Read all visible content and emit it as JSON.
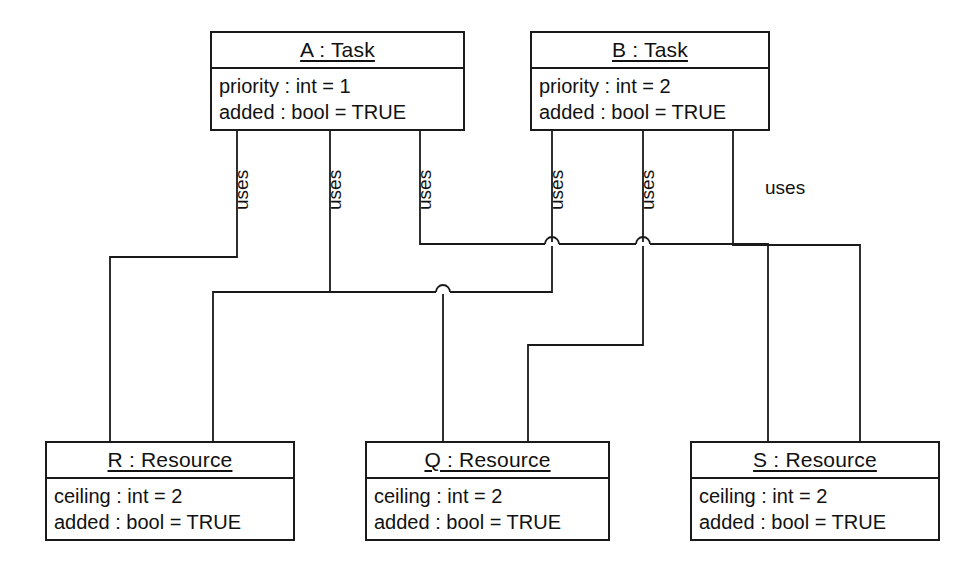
{
  "diagram": {
    "kind": "uml-object-diagram",
    "background_color": "#ffffff",
    "line_color": "#1a1a1a",
    "text_color": "#111111",
    "objects": [
      {
        "id": "A",
        "title": "A : Task",
        "attributes": [
          "priority : int = 1",
          "added : bool = TRUE"
        ],
        "x": 210,
        "y": 31,
        "w": 255,
        "h": 100
      },
      {
        "id": "B",
        "title": "B : Task",
        "attributes": [
          "priority : int = 2",
          "added : bool = TRUE"
        ],
        "x": 530,
        "y": 31,
        "w": 240,
        "h": 100
      },
      {
        "id": "R",
        "title": "R : Resource",
        "attributes": [
          "ceiling : int = 2",
          "added : bool = TRUE"
        ],
        "x": 45,
        "y": 441,
        "w": 250,
        "h": 100
      },
      {
        "id": "Q",
        "title": "Q : Resource",
        "attributes": [
          "ceiling : int = 2",
          "added : bool = TRUE"
        ],
        "x": 365,
        "y": 441,
        "w": 245,
        "h": 100
      },
      {
        "id": "S",
        "title": "S : Resource",
        "attributes": [
          "ceiling : int = 2",
          "added : bool = TRUE"
        ],
        "x": 690,
        "y": 441,
        "w": 250,
        "h": 100
      }
    ],
    "links": [
      {
        "id": "link-a-r",
        "label": "uses",
        "from": "A",
        "to": "R",
        "label_x": 231,
        "label_y": 210,
        "label_orientation": "vertical",
        "path": "M 237 131 L 237 257 L 110 257 L 110 441"
      },
      {
        "id": "link-a-q",
        "label": "uses",
        "from": "A",
        "to": "Q",
        "label_x": 324,
        "label_y": 210,
        "label_orientation": "vertical",
        "path": "M 330 131 L 330 292 L 443 292 L 443 441"
      },
      {
        "id": "link-a-s",
        "label": "uses",
        "from": "A",
        "to": "S",
        "label_x": 414,
        "label_y": 210,
        "label_orientation": "vertical",
        "path": "M 420 131 L 420 244 L 768 244 L 768 441"
      },
      {
        "id": "link-b-r",
        "label": "uses",
        "from": "B",
        "to": "R",
        "label_x": 546,
        "label_y": 210,
        "label_orientation": "vertical",
        "path": "M 552 131 L 552 292 L 213 292 L 213 441"
      },
      {
        "id": "link-b-q",
        "label": "uses",
        "from": "B",
        "to": "Q",
        "label_x": 637,
        "label_y": 210,
        "label_orientation": "vertical",
        "path": "M 643 131 L 643 345 L 528 345 L 528 441"
      },
      {
        "id": "link-b-s",
        "label": "uses",
        "from": "B",
        "to": "S",
        "label_x": 765,
        "label_y": 177,
        "label_orientation": "horizontal",
        "path": "M 733 131 L 733 245 L 860 245 L 860 441"
      }
    ],
    "line_jumps": [
      {
        "x": 552,
        "y": 244,
        "orientation": "up"
      },
      {
        "x": 643,
        "y": 244,
        "orientation": "up"
      },
      {
        "x": 443,
        "y": 292,
        "orientation": "up"
      }
    ]
  }
}
